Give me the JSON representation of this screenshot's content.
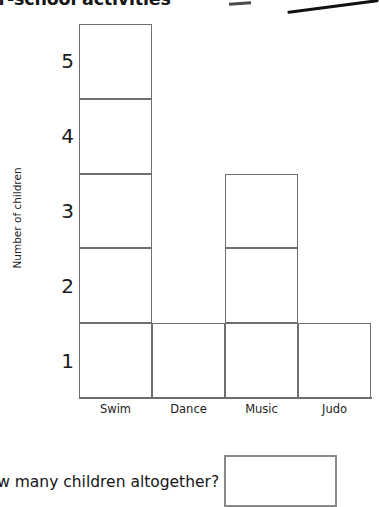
{
  "page": {
    "title": "After-school activities",
    "title_clipped": true,
    "question": "How many children altogether?",
    "answer_value": ""
  },
  "marks": {
    "dash": "pen-dash-mark",
    "stroke": "pen-stroke-mark"
  },
  "chart_data": {
    "type": "bar",
    "title": "After-school activities",
    "categories": [
      "Swim",
      "Dance",
      "Music",
      "Judo"
    ],
    "values": [
      5,
      1,
      3,
      1
    ],
    "xlabel": "",
    "ylabel": "Number of children",
    "ylim": [
      0,
      5
    ],
    "yticks": [
      5,
      4,
      3,
      2,
      1
    ],
    "grid": false,
    "style": "unit-squares",
    "legend": "none",
    "total": 10
  }
}
